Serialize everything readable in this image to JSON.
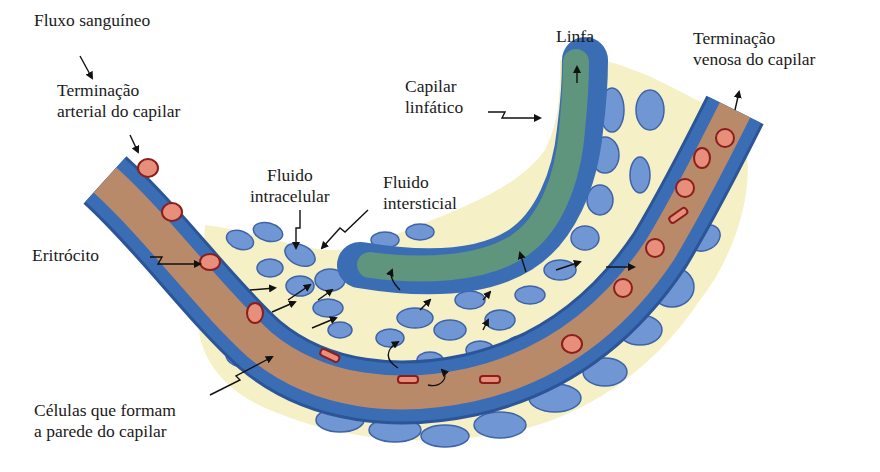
{
  "figure": {
    "colors": {
      "background": "#ffffff",
      "interstitial_fluid": "#f6f0c6",
      "cell_fill": "#7196d4",
      "cell_stroke": "#3d63a8",
      "vessel_wall": "#3b6db5",
      "vessel_wall_dark": "#2c5597",
      "blood_lumen": "#b98a6a",
      "lymph_lumen": "#5f957c",
      "erythrocyte": "#e88f7b",
      "erythrocyte_stroke": "#8b1d1d",
      "arrow": "#111111"
    }
  },
  "labels": {
    "fluxo": "Fluxo sanguíneo",
    "arterial_line1": "Terminação",
    "arterial_line2": "arterial do capilar",
    "eritrocito": "Eritrócito",
    "intracelular_line1": "Fluido",
    "intracelular_line2": "intracelular",
    "intersticial_line1": "Fluido",
    "intersticial_line2": "intersticial",
    "linfa": "Linfa",
    "capilar_linfatico_line1": "Capilar",
    "capilar_linfatico_line2": "linfático",
    "venosa_line1": "Terminação",
    "venosa_line2": "venosa do capilar",
    "celulas_line1": "Células que formam",
    "celulas_line2": "a parede do capilar"
  }
}
